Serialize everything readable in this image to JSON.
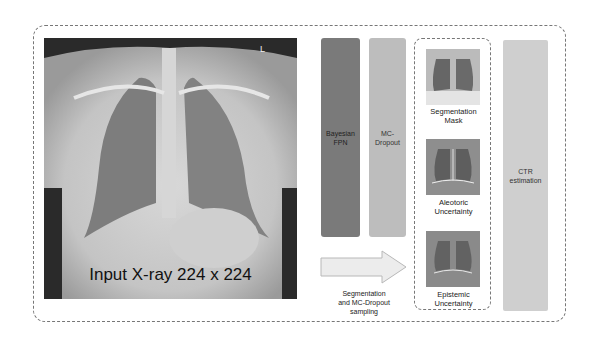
{
  "diagram": {
    "input": {
      "caption": "Input  X-ray 224 x 224",
      "marker": "L"
    },
    "blocks": [
      {
        "id": "bayesian-fpn",
        "label_line1": "Bayesian",
        "label_line2": "FPN",
        "color": "#7a7a7a"
      },
      {
        "id": "mc-dropout",
        "label_line1": "MC-",
        "label_line2": "Dropout",
        "color": "#bdbdbd"
      }
    ],
    "arrow_label": {
      "line1": "Segmentation",
      "line2": "and MC-Dropout",
      "line3": "sampling"
    },
    "outputs": [
      {
        "label_line1": "Segmentation",
        "label_line2": "Mask"
      },
      {
        "label_line1": "Aleotoric",
        "label_line2": "Uncertainty"
      },
      {
        "label_line1": "Epistemic",
        "label_line2": "Uncertainty"
      }
    ],
    "final": {
      "label_line1": "CTR",
      "label_line2": "estimation",
      "color": "#cfcfcf"
    }
  }
}
